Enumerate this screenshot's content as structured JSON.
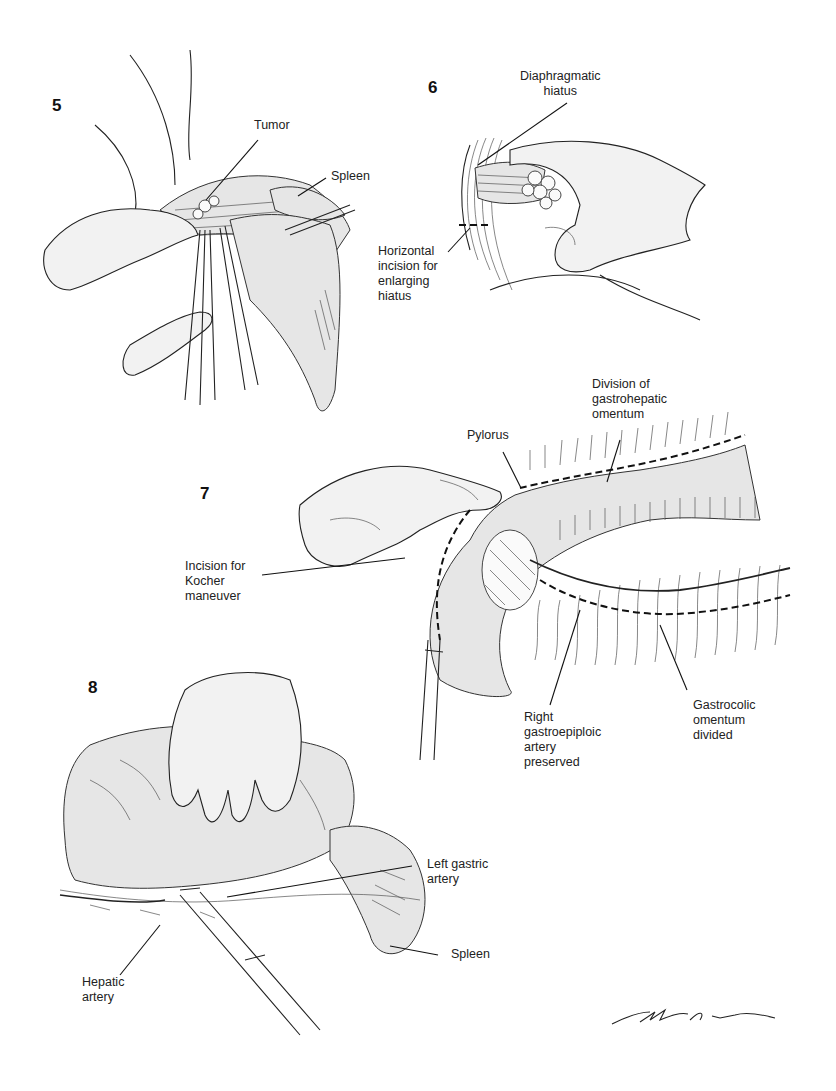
{
  "figures": [
    {
      "number": "5",
      "labels": {
        "tumor": "Tumor",
        "spleen": "Spleen"
      }
    },
    {
      "number": "6",
      "labels": {
        "diaphragmatic_hiatus": "Diaphragmatic\nhiatus",
        "horizontal_incision": "Horizontal\nincision for\nenlarging\nhiatus"
      }
    },
    {
      "number": "7",
      "labels": {
        "division_gastrohepatic": "Division of\ngastrohepatic\nomentum",
        "pylorus": "Pylorus",
        "kocher_incision": "Incision for\nKocher\nmaneuver",
        "right_gastroepiploic": "Right\ngastroepiploic\nartery\npreserved",
        "gastrocolic_omentum": "Gastrocolic\nomentum\ndivided"
      }
    },
    {
      "number": "8",
      "labels": {
        "left_gastric_artery": "Left gastric\nartery",
        "spleen": "Spleen",
        "hepatic_artery": "Hepatic\nartery"
      }
    }
  ],
  "signature": "M.B. Itam (artist signature)",
  "colors": {
    "ink": "#1a1a1a",
    "shade": "#e6e6e6",
    "background": "#ffffff"
  }
}
